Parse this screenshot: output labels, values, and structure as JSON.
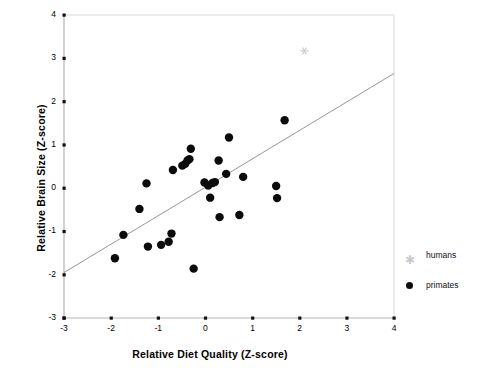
{
  "figure": {
    "faint_top_title": "",
    "xlabel": "Relative Diet Quality (Z-score)",
    "ylabel": "Relative Brain Size (Z-score)"
  },
  "legend": {
    "position": "right",
    "items": [
      {
        "label": "humans",
        "marker": "asterisk-icon",
        "color": "#c9c9c9"
      },
      {
        "label": "primates",
        "marker": "filled-circle-icon",
        "color": "#0b0b0b"
      }
    ]
  },
  "axes": {
    "x_ticks": [
      "-3",
      "-2",
      "-1",
      "0",
      "1",
      "2",
      "3",
      "4"
    ],
    "y_ticks": [
      "4",
      "3",
      "2",
      "1",
      "0",
      "-1",
      "-2",
      "-3"
    ]
  },
  "chart_data": {
    "type": "scatter",
    "title": "",
    "xlabel": "Relative Diet Quality (Z-score)",
    "ylabel": "Relative Brain Size (Z-score)",
    "xlim": [
      -3,
      4
    ],
    "ylim": [
      -3,
      4
    ],
    "grid": false,
    "legend_position": "right",
    "series": [
      {
        "name": "primates",
        "marker": "filled-circle",
        "color": "#0b0b0b",
        "points": [
          [
            -1.74,
            -1.08
          ],
          [
            -1.92,
            -1.62
          ],
          [
            -1.4,
            -0.48
          ],
          [
            -1.25,
            0.11
          ],
          [
            -1.22,
            -1.35
          ],
          [
            -0.94,
            -1.31
          ],
          [
            -0.78,
            -1.24
          ],
          [
            -0.72,
            -1.05
          ],
          [
            -0.69,
            0.42
          ],
          [
            -0.49,
            0.52
          ],
          [
            -0.43,
            0.56
          ],
          [
            -0.38,
            0.64
          ],
          [
            -0.34,
            0.67
          ],
          [
            -0.31,
            0.91
          ],
          [
            -0.25,
            -1.86
          ],
          [
            -0.02,
            0.13
          ],
          [
            0.06,
            0.06
          ],
          [
            0.1,
            -0.22
          ],
          [
            0.15,
            0.12
          ],
          [
            0.2,
            0.14
          ],
          [
            0.28,
            0.64
          ],
          [
            0.3,
            -0.67
          ],
          [
            0.44,
            0.33
          ],
          [
            0.5,
            1.17
          ],
          [
            0.72,
            -0.62
          ],
          [
            0.8,
            0.26
          ],
          [
            1.5,
            0.05
          ],
          [
            1.52,
            -0.23
          ],
          [
            1.68,
            1.57
          ]
        ]
      },
      {
        "name": "humans",
        "marker": "asterisk",
        "color": "#c9c9c9",
        "points": [
          [
            2.1,
            3.17
          ]
        ]
      }
    ],
    "trendline": {
      "name": "regression-line",
      "color": "#8a8a8a",
      "x_start": -3,
      "y_start": -1.95,
      "x_end": 4,
      "y_end": 2.65,
      "slope": 0.657,
      "intercept": 0.02
    }
  }
}
